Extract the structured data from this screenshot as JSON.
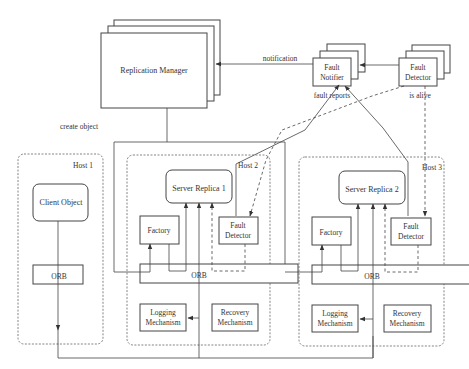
{
  "diagram": {
    "replication_manager": "Replication Manager",
    "fault_notifier": [
      "Fault",
      "Notifier"
    ],
    "fault_detector_top": [
      "Fault",
      "Detector"
    ],
    "edges": {
      "notification": "notification",
      "fault_reports": "fault reports",
      "is_alive": "is alive",
      "create_object": "create object"
    },
    "host1": {
      "label": "Host 1",
      "client_object": "Client Object",
      "orb": "ORB"
    },
    "host2": {
      "label": "Host 2",
      "server_replica": "Server Replica 1",
      "factory": "Factory",
      "fault_detector": [
        "Fault",
        "Detector"
      ],
      "orb": "ORB",
      "logging": [
        "Logging",
        "Mechanism"
      ],
      "recovery": [
        "Recovery",
        "Mechanism"
      ]
    },
    "host3": {
      "label": "Host 3",
      "server_replica": "Server Replica 2",
      "factory": "Factory",
      "fault_detector": [
        "Fault",
        "Detector"
      ],
      "orb": "ORB",
      "logging": [
        "Logging",
        "Mechanism"
      ],
      "recovery": [
        "Recovery",
        "Mechanism"
      ]
    }
  }
}
